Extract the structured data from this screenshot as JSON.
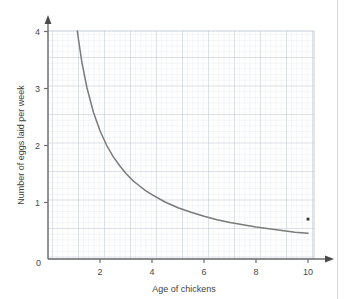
{
  "chart_data": {
    "type": "line",
    "title": "",
    "xlabel": "Age of chickens",
    "ylabel": "Number of eggs laid per week",
    "xlim": [
      0,
      10.2
    ],
    "ylim": [
      0,
      4
    ],
    "xticks": [
      "2",
      "4",
      "6",
      "8",
      "10"
    ],
    "xtick_values": [
      2,
      4,
      6,
      8,
      10
    ],
    "yticks": [
      "1",
      "2",
      "3",
      "4"
    ],
    "ytick_values": [
      1,
      2,
      3,
      4
    ],
    "origin_label": "0",
    "grid": true,
    "grid_major_step_x": 1,
    "grid_major_step_y": 0.5,
    "grid_minor_step_x": 0.2,
    "grid_minor_step_y": 0.1,
    "legend": null,
    "series": [
      {
        "name": "eggs-vs-age-curve",
        "type": "line",
        "relationship": "y = 4.5 / x",
        "color": "#7a7a7a",
        "x": [
          1.125,
          1.3,
          1.5,
          1.75,
          2.0,
          2.25,
          2.5,
          2.75,
          3.0,
          3.25,
          3.5,
          3.75,
          4.0,
          4.5,
          5.0,
          5.5,
          6.0,
          6.5,
          7.0,
          7.5,
          8.0,
          8.5,
          9.0,
          9.5,
          10.0
        ],
        "y": [
          4.0,
          3.46,
          3.0,
          2.57,
          2.25,
          2.0,
          1.8,
          1.64,
          1.5,
          1.38,
          1.29,
          1.2,
          1.13,
          1.0,
          0.9,
          0.82,
          0.75,
          0.69,
          0.64,
          0.6,
          0.56,
          0.53,
          0.5,
          0.47,
          0.45
        ]
      },
      {
        "name": "marked-point",
        "type": "scatter",
        "color": "#333333",
        "x": [
          10.0
        ],
        "y": [
          0.7
        ]
      }
    ]
  },
  "colors": {
    "axis": "#6e6e6e",
    "grid_major": "#c2c8d4",
    "grid_minor": "#e4e8ef",
    "curve": "#7a7a7a",
    "point": "#333333",
    "text": "#4a4a4a",
    "page_rule": "#d8d8d8"
  }
}
